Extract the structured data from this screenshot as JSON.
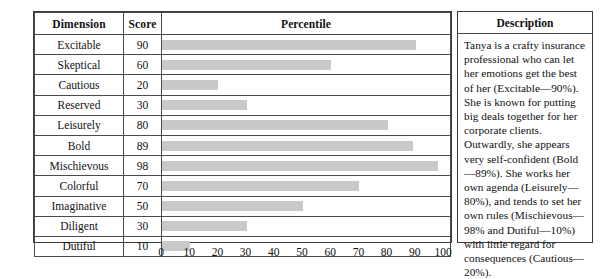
{
  "table": {
    "headers": [
      "Dimension",
      "Score",
      "Percentile"
    ],
    "rows": [
      {
        "dimension": "Excitable",
        "score": "90"
      },
      {
        "dimension": "Skeptical",
        "score": "60"
      },
      {
        "dimension": "Cautious",
        "score": "20"
      },
      {
        "dimension": "Reserved",
        "score": "30"
      },
      {
        "dimension": "Leisurely",
        "score": "80"
      },
      {
        "dimension": "Bold",
        "score": "89"
      },
      {
        "dimension": "Mischievous",
        "score": "98"
      },
      {
        "dimension": "Colorful",
        "score": "70"
      },
      {
        "dimension": "Imaginative",
        "score": "50"
      },
      {
        "dimension": "Diligent",
        "score": "30"
      },
      {
        "dimension": "Dutiful",
        "score": "10"
      }
    ]
  },
  "description": {
    "header": "Description",
    "text": "Tanya is a crafty insurance professional who can let her emotions get the best of her (Excitable—90%). She is known for putting big deals together for her corporate clients. Outwardly, she appears very self-confident (Bold—89%). She works her own agenda (Leisurely—80%), and tends to set her own rules (Mischievous—98% and Dutiful—10%) with little regard for consequences (Cautious—20%)."
  },
  "axis": {
    "ticks": [
      "0",
      "10",
      "20",
      "30",
      "40",
      "50",
      "60",
      "70",
      "80",
      "90",
      "100"
    ]
  },
  "colors": {
    "bar_fill": "#c9c9c9",
    "border": "#3a3a3a",
    "grid_line": "#4a4a4a",
    "text": "#111111",
    "background": "#ffffff"
  },
  "chart_data": {
    "type": "bar",
    "orientation": "horizontal",
    "title": "Percentile",
    "xlabel": "",
    "ylabel": "Dimension",
    "categories": [
      "Excitable",
      "Skeptical",
      "Cautious",
      "Reserved",
      "Leisurely",
      "Bold",
      "Mischievous",
      "Colorful",
      "Imaginative",
      "Diligent",
      "Dutiful"
    ],
    "values": [
      90,
      60,
      20,
      30,
      80,
      89,
      98,
      70,
      50,
      30,
      10
    ],
    "xlim": [
      0,
      100
    ],
    "xticks": [
      0,
      10,
      20,
      30,
      40,
      50,
      60,
      70,
      80,
      90,
      100
    ],
    "grid": false,
    "legend": false,
    "bar_color": "#c9c9c9"
  }
}
